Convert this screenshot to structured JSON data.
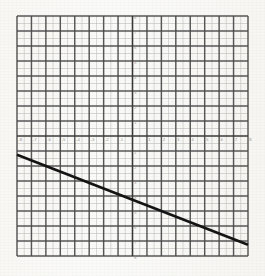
{
  "figure": {
    "kind": "coordinate-grid-line-graph",
    "background_color": "#faf9f7",
    "major_grid_color": "#4a4a4a",
    "minor_grid_color": "#b9b9b6",
    "axis_color": "#3a3a3a",
    "line_color": "#141414"
  },
  "axes": {
    "x_label": "",
    "y_label": "",
    "x_tick_labels": [
      "-8",
      "-7",
      "-6",
      "-5",
      "-4",
      "-3",
      "-2",
      "-1",
      "1",
      "2",
      "3",
      "4",
      "5",
      "6",
      "7",
      "8"
    ],
    "y_tick_labels": [
      "8",
      "7",
      "6",
      "5",
      "4",
      "3",
      "2",
      "1",
      "1",
      "2",
      "3",
      "4",
      "5",
      "6",
      "7",
      "8"
    ],
    "origin_label": ""
  },
  "chart_data": {
    "type": "line",
    "title": "",
    "xlabel": "",
    "ylabel": "",
    "xlim": [
      -8,
      8
    ],
    "ylim": [
      -8,
      8
    ],
    "x_major_step": 1,
    "y_major_step": 1,
    "minor_subdivisions": 2,
    "grid": true,
    "legend": false,
    "series": [
      {
        "name": "line",
        "kind": "segment",
        "slope": -0.375,
        "intercept": -4.25,
        "x": [
          -8,
          8
        ],
        "values": [
          -1.25,
          -7.25
        ],
        "points": [
          {
            "x": -8,
            "y": -1.25
          },
          {
            "x": 0,
            "y": -4.25
          },
          {
            "x": 8,
            "y": -7.25
          }
        ],
        "color": "#141414",
        "width_px": 2.6
      }
    ],
    "annotations": []
  }
}
